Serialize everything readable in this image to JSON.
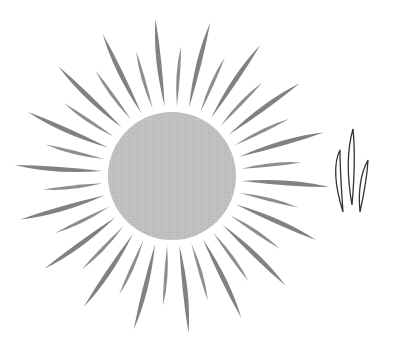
{
  "illustration": {
    "background": "#ffffff",
    "sun": {
      "center": [
        172,
        176
      ],
      "disc_radius": 64,
      "disc_color": "#bdbdbd",
      "ray_color": "#7a7a7a",
      "ray_count": 36,
      "ray_inner_gap": 6,
      "long_ray_length": 88,
      "short_ray_length": 60,
      "ray_width_long": 7,
      "ray_width_short": 5
    },
    "flame_icon": {
      "stroke": "#333333",
      "stroke_width": 1.3,
      "blades": [
        {
          "x1": 343,
          "y1": 212,
          "cx": 335,
          "cy": 170,
          "x2": 340,
          "y2": 150,
          "bulge": 5
        },
        {
          "x1": 352,
          "y1": 205,
          "cx": 350,
          "cy": 160,
          "x2": 353,
          "y2": 129,
          "bulge": 6
        },
        {
          "x1": 360,
          "y1": 212,
          "cx": 362,
          "cy": 180,
          "x2": 368,
          "y2": 160,
          "bulge": 5
        }
      ]
    }
  }
}
